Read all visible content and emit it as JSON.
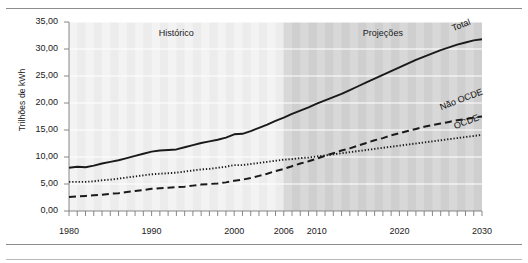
{
  "chart_data": {
    "type": "line",
    "title": "",
    "subtitle": "",
    "xlabel": "",
    "ylabel": "Trilhões de kWh",
    "xlim": [
      1980,
      2030
    ],
    "ylim": [
      0,
      35
    ],
    "ytick_step": 5,
    "ytick_labels": [
      "35,00",
      "30,00",
      "25,00",
      "20,00",
      "15,00",
      "10,00",
      "5,00",
      "0,00"
    ],
    "ytick_values": [
      35,
      30,
      25,
      20,
      15,
      10,
      5,
      0
    ],
    "xtick_labels": [
      "1980",
      "1990",
      "2000",
      "2006",
      "2010",
      "2020",
      "2030"
    ],
    "xtick_values": [
      1980,
      1990,
      2000,
      2006,
      2010,
      2020,
      2030
    ],
    "minor_xticks": "every year from 1980 to 2030",
    "grid": "horizontal white gridlines over banded vertical stripes",
    "legend": "inline end-of-line labels",
    "legend_position": "right",
    "zones": [
      {
        "name": "Histórico",
        "label": "Histórico",
        "from": 1980,
        "to": 2006,
        "shade": "#ececec"
      },
      {
        "name": "Projeções",
        "label": "Projeções",
        "from": 2006,
        "to": 2030,
        "shade": "#cfcfcf"
      }
    ],
    "x": [
      1980,
      1981,
      1982,
      1983,
      1984,
      1985,
      1986,
      1987,
      1988,
      1989,
      1990,
      1991,
      1992,
      1993,
      1994,
      1995,
      1996,
      1997,
      1998,
      1999,
      2000,
      2001,
      2002,
      2003,
      2004,
      2005,
      2006,
      2007,
      2008,
      2009,
      2010,
      2011,
      2012,
      2013,
      2014,
      2015,
      2016,
      2017,
      2018,
      2019,
      2020,
      2021,
      2022,
      2023,
      2024,
      2025,
      2026,
      2027,
      2028,
      2029,
      2030
    ],
    "series": [
      {
        "name": "Total",
        "label": "Total",
        "style": "solid",
        "color": "#1a1a1a",
        "values": [
          8.0,
          8.2,
          8.1,
          8.4,
          8.8,
          9.1,
          9.4,
          9.8,
          10.2,
          10.6,
          11.0,
          11.2,
          11.3,
          11.4,
          11.8,
          12.2,
          12.6,
          12.9,
          13.2,
          13.6,
          14.2,
          14.3,
          14.8,
          15.4,
          16.0,
          16.7,
          17.3,
          18.0,
          18.6,
          19.2,
          19.9,
          20.5,
          21.1,
          21.7,
          22.4,
          23.1,
          23.8,
          24.5,
          25.2,
          25.9,
          26.6,
          27.3,
          28.0,
          28.6,
          29.2,
          29.8,
          30.3,
          30.8,
          31.2,
          31.6,
          31.8
        ]
      },
      {
        "name": "OCDE",
        "label": "OCDE",
        "style": "dotted",
        "color": "#1a1a1a",
        "values": [
          5.4,
          5.4,
          5.4,
          5.5,
          5.7,
          5.8,
          6.0,
          6.2,
          6.4,
          6.6,
          6.8,
          6.9,
          7.0,
          7.1,
          7.3,
          7.5,
          7.7,
          7.8,
          8.0,
          8.2,
          8.5,
          8.5,
          8.7,
          8.9,
          9.1,
          9.3,
          9.5,
          9.6,
          9.8,
          9.9,
          10.1,
          10.3,
          10.5,
          10.7,
          10.9,
          11.1,
          11.3,
          11.5,
          11.7,
          11.9,
          12.1,
          12.3,
          12.5,
          12.7,
          12.9,
          13.1,
          13.3,
          13.5,
          13.7,
          13.9,
          14.1
        ]
      },
      {
        "name": "Não OCDE",
        "label": "Não OCDE",
        "style": "dashed",
        "color": "#1a1a1a",
        "values": [
          2.6,
          2.7,
          2.8,
          2.9,
          3.0,
          3.2,
          3.3,
          3.5,
          3.7,
          3.9,
          4.1,
          4.2,
          4.3,
          4.4,
          4.5,
          4.7,
          4.9,
          5.0,
          5.1,
          5.3,
          5.6,
          5.8,
          6.1,
          6.5,
          6.9,
          7.4,
          7.8,
          8.3,
          8.8,
          9.2,
          9.7,
          10.2,
          10.7,
          11.2,
          11.6,
          12.1,
          12.6,
          13.1,
          13.5,
          14.0,
          14.4,
          14.8,
          15.2,
          15.6,
          15.9,
          16.2,
          16.5,
          16.8,
          17.0,
          17.3,
          17.5
        ]
      }
    ]
  },
  "style": {
    "band_light": "#ececec",
    "band_dark": "#cfcfcf",
    "stripe_light": "#f3f3f3",
    "stripe_dark": "#d8d8d8",
    "gridline": "#ffffff",
    "axis": "#7a7a7a",
    "line": "#1a1a1a",
    "rule": "#8d8d8d"
  }
}
